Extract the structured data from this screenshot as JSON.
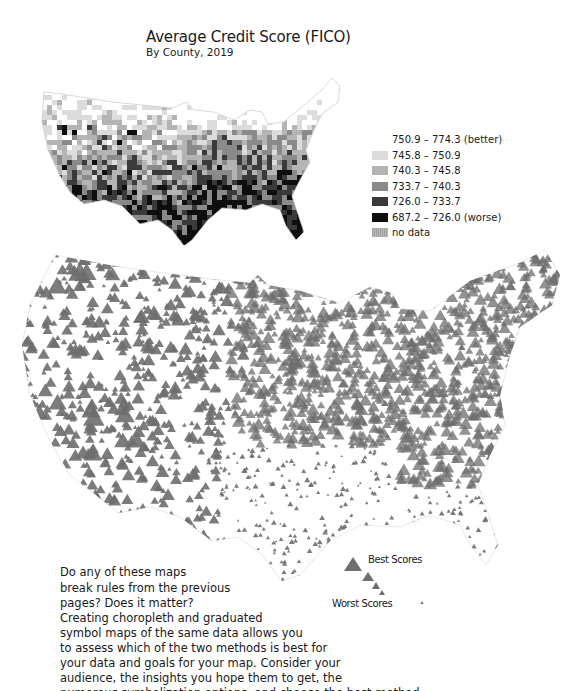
{
  "header": {
    "title": "Average Credit Score (FICO)",
    "subtitle": "By County, 2019"
  },
  "choropleth_legend": {
    "items": [
      {
        "label": "750.9 – 774.3 (better)",
        "color": "#ffffff"
      },
      {
        "label": "745.8 – 750.9",
        "color": "#dcdcdc"
      },
      {
        "label": "740.3 – 745.8",
        "color": "#b4b4b4"
      },
      {
        "label": "733.7 – 740.3",
        "color": "#8a8a8a"
      },
      {
        "label": "726.0 – 733.7",
        "color": "#3a3a3a"
      },
      {
        "label": "687.2 – 726.0 (worse)",
        "color": "#0e0e0e"
      },
      {
        "label": "no data",
        "color": "#a8a8a8"
      }
    ]
  },
  "symbol_legend": {
    "best_label": "Best Scores",
    "worst_label": "Worst Scores",
    "symbol_color": "#6e6e6e",
    "symbol_shape": "triangle-icon"
  },
  "text": {
    "question_lines": [
      "Do any of these maps",
      "break rules from the previous",
      "pages? Does it matter?"
    ],
    "body_lines": [
      "Creating choropleth and graduated",
      "symbol maps of the same data allows you",
      "to assess which of the two methods is best for",
      "your data and goals for your map. Consider your",
      "audience, the insights you hope them to get, the",
      "numerous symbolization options, and choose the best method."
    ]
  }
}
